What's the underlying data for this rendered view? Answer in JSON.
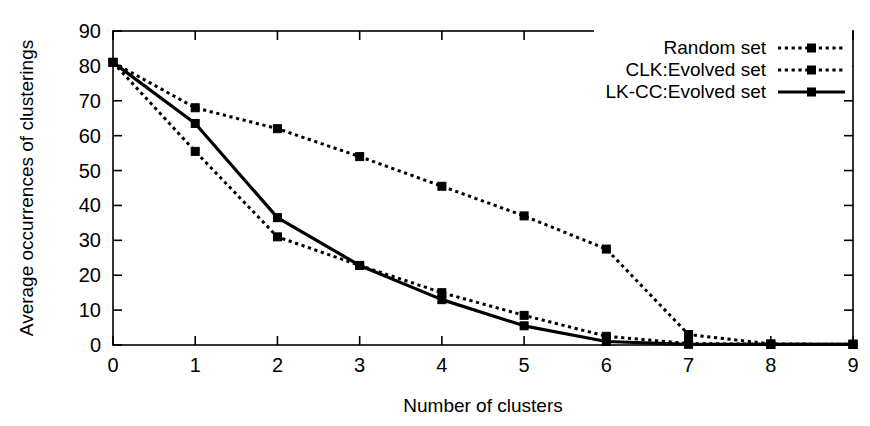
{
  "chart_data": {
    "type": "line",
    "title": "",
    "xlabel": "Number of clusters",
    "ylabel": "Average occurrences of clusterings",
    "xlim": [
      0,
      9
    ],
    "ylim": [
      0,
      90
    ],
    "xticks": [
      "0",
      "1",
      "2",
      "3",
      "4",
      "5",
      "6",
      "7",
      "8",
      "9"
    ],
    "yticks": [
      "0",
      "10",
      "20",
      "30",
      "40",
      "50",
      "60",
      "70",
      "80",
      "90"
    ],
    "grid": false,
    "legend_position": "top-right",
    "x": [
      0,
      1,
      2,
      3,
      4,
      5,
      6,
      7,
      8,
      9
    ],
    "series": [
      {
        "name": "Random set",
        "style": "dotted",
        "marker": "square",
        "color": "#000000",
        "values": [
          81,
          68,
          62,
          54,
          45.5,
          37,
          27.5,
          3,
          0.3,
          0.2
        ]
      },
      {
        "name": "CLK:Evolved set",
        "style": "dotted",
        "marker": "square",
        "color": "#000000",
        "values": [
          81,
          55.5,
          31,
          22.8,
          15,
          8.5,
          2.5,
          0.4,
          0.2,
          0.2
        ]
      },
      {
        "name": "LK-CC:Evolved set",
        "style": "solid",
        "marker": "square",
        "color": "#000000",
        "values": [
          81,
          63.5,
          36.5,
          22.8,
          13,
          5.5,
          1,
          0.2,
          0.2,
          0.2
        ]
      }
    ]
  },
  "legend": {
    "entries": [
      {
        "label": "Random set"
      },
      {
        "label": "CLK:Evolved set"
      },
      {
        "label": "LK-CC:Evolved set"
      }
    ]
  }
}
